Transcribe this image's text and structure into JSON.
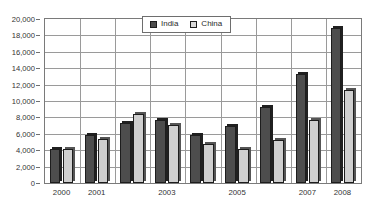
{
  "chart_data": {
    "type": "bar",
    "title": "",
    "subtitle": "",
    "xlabel": "",
    "ylabel": "",
    "categories": [
      "2000",
      "2001",
      "2002",
      "2003",
      "2004",
      "2005",
      "2006",
      "2007",
      "2008"
    ],
    "visible_tick_labels": [
      "2000",
      "2001",
      "",
      "2003",
      "",
      "2005",
      "",
      "2007",
      "2008"
    ],
    "series": [
      {
        "name": "India",
        "color": "#4d4d4d",
        "values": [
          4100,
          5800,
          7300,
          7700,
          5900,
          7000,
          9300,
          13300,
          18900
        ]
      },
      {
        "name": "China",
        "color": "#cfcfcf",
        "values": [
          4100,
          5400,
          8400,
          7100,
          4700,
          4100,
          5300,
          7700,
          11400
        ]
      }
    ],
    "ylim": [
      0,
      20000
    ],
    "ytick_step": 2000,
    "ytick_labels": [
      "0",
      "2,000",
      "4,000",
      "6,000",
      "8,000",
      "10,000",
      "12,000",
      "14,000",
      "16,000",
      "18,000",
      "20,000"
    ],
    "ytick_values": [
      0,
      2000,
      4000,
      6000,
      8000,
      10000,
      12000,
      14000,
      16000,
      18000,
      20000
    ],
    "grid": true,
    "grid_axis": "both",
    "legend": {
      "position": "top-center",
      "entries": [
        {
          "label": "India",
          "color": "#4d4d4d"
        },
        {
          "label": "China",
          "color": "#d8d8d8"
        }
      ]
    }
  }
}
